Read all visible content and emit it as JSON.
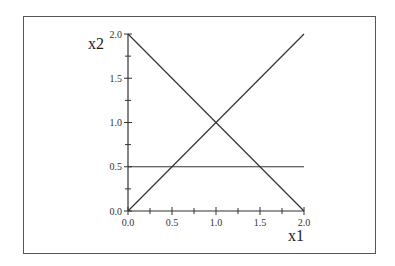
{
  "chart_data": {
    "type": "line",
    "title": "",
    "xlabel": "x1",
    "ylabel": "x2",
    "xlim": [
      0,
      2
    ],
    "ylim": [
      0,
      2
    ],
    "grid": false,
    "legend": null,
    "x_ticks_major": [
      "0.0",
      "0.5",
      "1.0",
      "1.5",
      "2.0"
    ],
    "y_ticks_major": [
      "0.0",
      "0.5",
      "1.0",
      "1.5",
      "2.0"
    ],
    "x_ticks_minor": [
      0.25,
      0.75,
      1.25,
      1.75
    ],
    "y_ticks_minor": [
      0.25,
      0.75,
      1.25,
      1.75
    ],
    "series": [
      {
        "name": "x2 = x1",
        "x": [
          0,
          2
        ],
        "y": [
          0,
          2
        ]
      },
      {
        "name": "x2 = 2 - x1",
        "x": [
          0,
          2
        ],
        "y": [
          2,
          0
        ]
      },
      {
        "name": "x2 = 0.5",
        "x": [
          0,
          2
        ],
        "y": [
          0.5,
          0.5
        ]
      }
    ],
    "line_color": "#333333",
    "frame_color": "#555555"
  }
}
